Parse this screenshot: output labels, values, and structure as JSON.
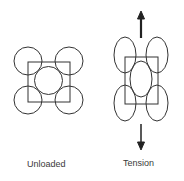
{
  "labels": {
    "unloaded": "Unloaded",
    "tension": "Tension"
  },
  "colors": {
    "stroke": "#333333",
    "background": "#ffffff"
  }
}
